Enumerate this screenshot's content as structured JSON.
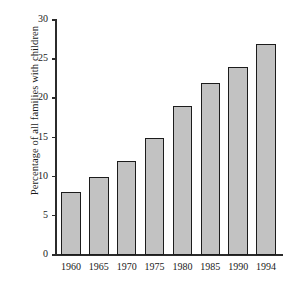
{
  "chart_data": {
    "type": "bar",
    "title": "",
    "subtitle": "",
    "xlabel": "",
    "ylabel": "Percentage of all families with children",
    "categories": [
      "1960",
      "1965",
      "1970",
      "1975",
      "1980",
      "1985",
      "1990",
      "1994"
    ],
    "values": [
      8,
      10,
      12,
      15,
      19,
      22,
      24,
      27
    ],
    "ylim": [
      0,
      30
    ],
    "yticks": [
      0,
      5,
      10,
      15,
      20,
      25,
      30
    ],
    "ytick_labels": [
      "0",
      "5",
      "10",
      "15",
      "20",
      "25",
      "30"
    ],
    "grid": false,
    "legend": null,
    "legend_position": "none",
    "series": [
      {
        "name": "Percentage of all families with children",
        "values": [
          8,
          10,
          12,
          15,
          19,
          22,
          24,
          27
        ]
      }
    ],
    "bar_fill_color": "#c2c2c2",
    "bar_border_color": "#1c1c1c",
    "axis_color": "#2b2b2b",
    "background_color": "#ffffff",
    "annotations": []
  }
}
